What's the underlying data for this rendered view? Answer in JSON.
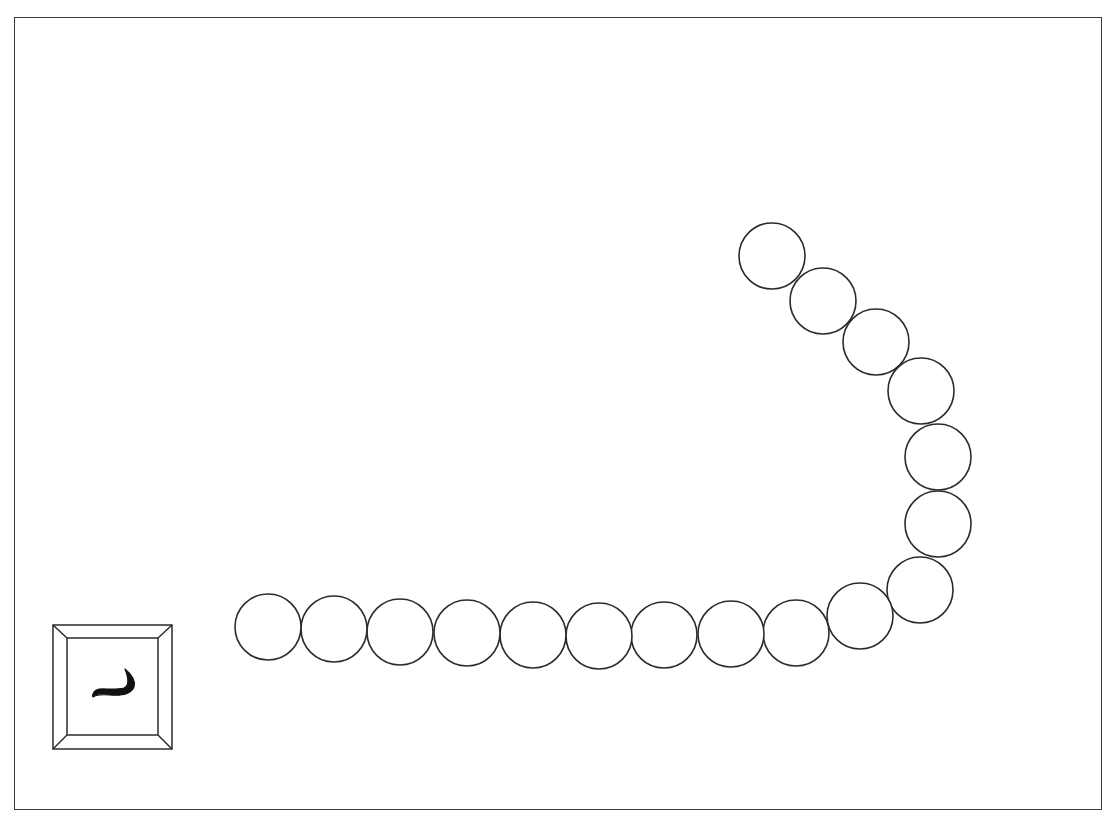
{
  "game": {
    "board": {
      "frame": {
        "x": 14,
        "y": 17,
        "width": 1088,
        "height": 793,
        "stroke": "#3a3a3a"
      }
    },
    "chain": {
      "circle_radius": 33,
      "stroke": "#2b2b2b",
      "fill": "#ffffff",
      "beads": [
        {
          "cx": 772,
          "cy": 256
        },
        {
          "cx": 823,
          "cy": 301
        },
        {
          "cx": 876,
          "cy": 342
        },
        {
          "cx": 921,
          "cy": 391
        },
        {
          "cx": 938,
          "cy": 457
        },
        {
          "cx": 938,
          "cy": 524
        },
        {
          "cx": 920,
          "cy": 590
        },
        {
          "cx": 860,
          "cy": 616
        },
        {
          "cx": 796,
          "cy": 633
        },
        {
          "cx": 731,
          "cy": 634
        },
        {
          "cx": 664,
          "cy": 635
        },
        {
          "cx": 599,
          "cy": 636
        },
        {
          "cx": 533,
          "cy": 635
        },
        {
          "cx": 467,
          "cy": 633
        },
        {
          "cx": 400,
          "cy": 632
        },
        {
          "cx": 334,
          "cy": 629
        },
        {
          "cx": 268,
          "cy": 627
        }
      ]
    },
    "key_tile": {
      "icon": "keycap-icon",
      "character": "ں",
      "outer": {
        "x": 53,
        "y": 625,
        "width": 119,
        "height": 124
      },
      "inner": {
        "x": 67,
        "y": 638,
        "width": 91,
        "height": 97
      },
      "stroke": "#2b2b2b",
      "glyph_color": "#111111"
    }
  }
}
